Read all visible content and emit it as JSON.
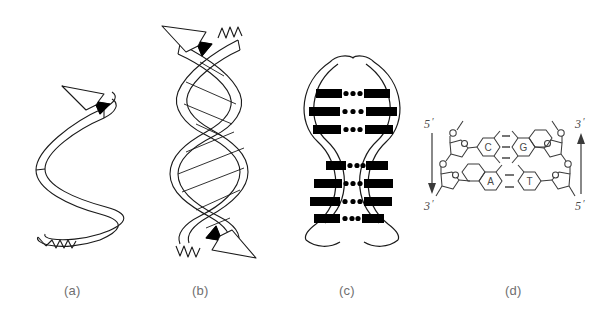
{
  "figure": {
    "background_color": "#ffffff",
    "stroke_color": "#1a1a1a",
    "fill_color": "#000000",
    "label_color": "#6f6f6f",
    "panel_labels": [
      {
        "id": "a",
        "text": "(a)",
        "description": "single helix ribbon with arrow"
      },
      {
        "id": "b",
        "text": "(b)",
        "description": "double helix of two antiparallel ribbons"
      },
      {
        "id": "c",
        "text": "(c)",
        "description": "double helix with base pair rungs"
      },
      {
        "id": "d",
        "text": "(d)",
        "description": "chemical structure of base pairs"
      }
    ]
  },
  "panel_a": {
    "label": "(a)",
    "strand_count": 1,
    "arrow_direction": "up-left",
    "frayed_end": "bottom"
  },
  "panel_b": {
    "label": "(b)",
    "strand_count": 2,
    "arrows": [
      {
        "position": "top",
        "direction": "up-left"
      },
      {
        "position": "bottom",
        "direction": "down-right"
      }
    ],
    "frayed_ends": [
      {
        "position": "top-right"
      },
      {
        "position": "bottom-left"
      }
    ]
  },
  "panel_c": {
    "label": "(c)",
    "strand_count": 2,
    "lens_count": 2,
    "rungs_upper": 3,
    "rungs_lower": 4,
    "dots_per_rung": 5
  },
  "panel_d": {
    "label": "(d)",
    "left_strand": {
      "top_label": "5",
      "top_prime": "′",
      "bottom_label": "3",
      "bottom_prime": "′",
      "arrow_direction": "down"
    },
    "right_strand": {
      "top_label": "3",
      "top_prime": "′",
      "bottom_label": "5",
      "bottom_prime": "′",
      "arrow_direction": "up"
    },
    "base_pairs": [
      {
        "left_base": "C",
        "right_base": "G",
        "hydrogen_bonds": 3,
        "bond_glyph": "|||",
        "left_type": "pyrimidine",
        "right_type": "purine"
      },
      {
        "left_base": "A",
        "right_base": "T",
        "hydrogen_bonds": 2,
        "bond_glyph": "||",
        "left_type": "purine",
        "right_type": "pyrimidine"
      }
    ]
  }
}
